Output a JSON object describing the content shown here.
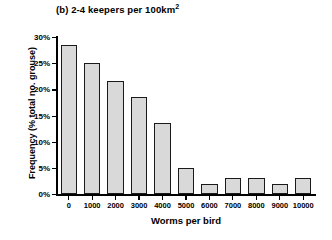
{
  "chart_data": {
    "type": "bar",
    "title_main": "(b) 2-4 keepers per 100km",
    "title_sup": "2",
    "xlabel": "Worms per bird",
    "ylabel": "Frequency (% total no. grouse)",
    "categories": [
      "0",
      "1000",
      "2000",
      "3000",
      "4000",
      "5000",
      "6000",
      "7000",
      "8000",
      "9000",
      "10000"
    ],
    "values": [
      28.5,
      25.0,
      21.5,
      18.5,
      13.5,
      5.0,
      2.0,
      3.0,
      3.0,
      2.0,
      3.0
    ],
    "xtick_labels": [
      "0",
      "1000",
      "2000",
      "3000",
      "4000",
      "5000",
      "6000",
      "7000",
      "8000",
      "9000",
      "10000"
    ],
    "ytick_labels": [
      "0%",
      "5%",
      "10%",
      "15%",
      "20%",
      "25%",
      "30%"
    ],
    "ytick_values": [
      0,
      5,
      10,
      15,
      20,
      25,
      30
    ],
    "ylim": [
      0,
      30
    ],
    "xlim": [
      0,
      11
    ],
    "grid": false,
    "legend": "none",
    "bar_fill_color": "#d9d9d9",
    "bar_edge_color": "#1a1a1a",
    "background_color": "#ffffff"
  }
}
